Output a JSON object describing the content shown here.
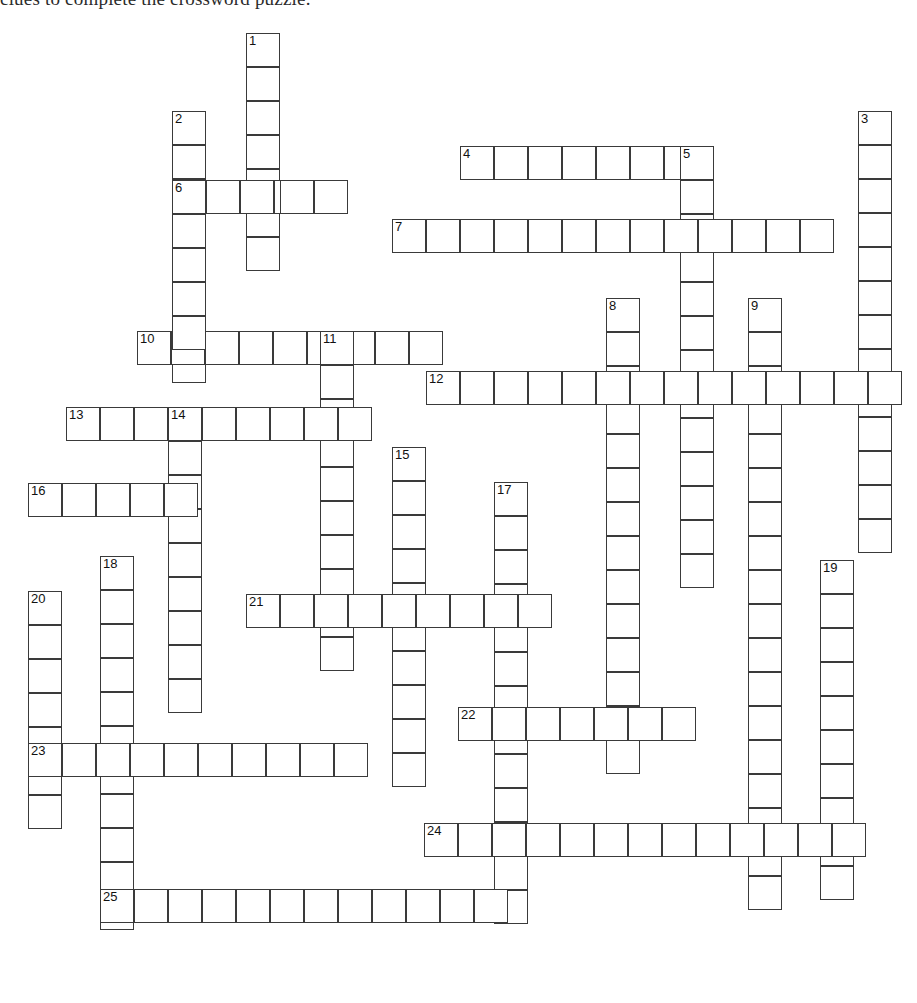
{
  "document": {
    "instruction_text": "clues to complete the crossword puzzle."
  },
  "puzzle": {
    "type": "crossword-grid",
    "cell_size_px": 34,
    "cell_border_color": "#3a3a3a",
    "cell_fill_color": "#ffffff",
    "number_count": 25,
    "entries": [
      {
        "number": "1",
        "direction": "down",
        "length": 7,
        "x": 246,
        "y": 33
      },
      {
        "number": "2",
        "direction": "down",
        "length": 8,
        "x": 172,
        "y": 111
      },
      {
        "number": "3",
        "direction": "down",
        "length": 13,
        "x": 858,
        "y": 111
      },
      {
        "number": "4",
        "direction": "across",
        "length": 7,
        "x": 460,
        "y": 146
      },
      {
        "number": "5",
        "direction": "down",
        "length": 13,
        "x": 680,
        "y": 146
      },
      {
        "number": "6",
        "direction": "across",
        "length": 5,
        "x": 172,
        "y": 180
      },
      {
        "number": "7",
        "direction": "across",
        "length": 13,
        "x": 392,
        "y": 219
      },
      {
        "number": "8",
        "direction": "down",
        "length": 14,
        "x": 606,
        "y": 298
      },
      {
        "number": "9",
        "direction": "down",
        "length": 18,
        "x": 748,
        "y": 298
      },
      {
        "number": "10",
        "direction": "across",
        "length": 9,
        "x": 137,
        "y": 331
      },
      {
        "number": "11",
        "direction": "down",
        "length": 10,
        "x": 320,
        "y": 331
      },
      {
        "number": "12",
        "direction": "across",
        "length": 14,
        "x": 426,
        "y": 371
      },
      {
        "number": "13",
        "direction": "across",
        "length": 9,
        "x": 66,
        "y": 407
      },
      {
        "number": "14",
        "direction": "down",
        "length": 9,
        "x": 168,
        "y": 407
      },
      {
        "number": "15",
        "direction": "down",
        "length": 10,
        "x": 392,
        "y": 447
      },
      {
        "number": "16",
        "direction": "across",
        "length": 5,
        "x": 28,
        "y": 483
      },
      {
        "number": "17",
        "direction": "down",
        "length": 13,
        "x": 494,
        "y": 482
      },
      {
        "number": "18",
        "direction": "down",
        "length": 11,
        "x": 100,
        "y": 556
      },
      {
        "number": "19",
        "direction": "down",
        "length": 10,
        "x": 820,
        "y": 560
      },
      {
        "number": "20",
        "direction": "down",
        "length": 7,
        "x": 28,
        "y": 591
      },
      {
        "number": "21",
        "direction": "across",
        "length": 9,
        "x": 246,
        "y": 594
      },
      {
        "number": "22",
        "direction": "across",
        "length": 7,
        "x": 458,
        "y": 707
      },
      {
        "number": "23",
        "direction": "across",
        "length": 10,
        "x": 28,
        "y": 743
      },
      {
        "number": "24",
        "direction": "across",
        "length": 13,
        "x": 424,
        "y": 823
      },
      {
        "number": "25",
        "direction": "across",
        "length": 12,
        "x": 100,
        "y": 889
      }
    ],
    "extra_cells": [
      {
        "x": 206,
        "y": 180
      },
      {
        "x": 280,
        "y": 180
      },
      {
        "x": 314,
        "y": 180
      },
      {
        "x": 172,
        "y": 145
      },
      {
        "x": 172,
        "y": 214
      },
      {
        "x": 172,
        "y": 248
      },
      {
        "x": 172,
        "y": 282
      },
      {
        "x": 172,
        "y": 316
      }
    ]
  }
}
